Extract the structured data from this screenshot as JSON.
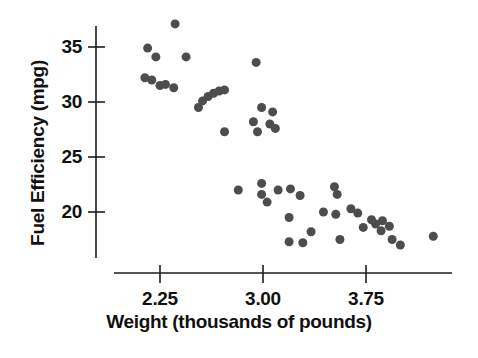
{
  "chart_data": {
    "type": "scatter",
    "title": "",
    "xlabel": "Weight (thousands of pounds)",
    "ylabel": "Fuel Efficiency (mpg)",
    "xlim": [
      1.89,
      4.33
    ],
    "ylim": [
      14.4,
      39.0
    ],
    "grid": false,
    "legend": null,
    "xticks": [
      2.25,
      3.0,
      3.75
    ],
    "xtick_labels": [
      "2.25",
      "3.00",
      "3.75"
    ],
    "yticks": [
      20,
      25,
      30,
      35
    ],
    "ytick_labels": [
      "20",
      "25",
      "30",
      "35"
    ],
    "marker_color": "#4d4d4d",
    "marker_size": 9,
    "axis_color": "#1c1c1c",
    "background_color": "#ffffff",
    "points": [
      {
        "x": 2.36,
        "y": 37.1
      },
      {
        "x": 2.16,
        "y": 34.9
      },
      {
        "x": 2.22,
        "y": 34.1
      },
      {
        "x": 2.44,
        "y": 34.1
      },
      {
        "x": 2.95,
        "y": 33.6
      },
      {
        "x": 2.14,
        "y": 32.2
      },
      {
        "x": 2.19,
        "y": 32.0
      },
      {
        "x": 2.25,
        "y": 31.5
      },
      {
        "x": 2.29,
        "y": 31.6
      },
      {
        "x": 2.35,
        "y": 31.3
      },
      {
        "x": 2.56,
        "y": 30.1
      },
      {
        "x": 2.6,
        "y": 30.5
      },
      {
        "x": 2.64,
        "y": 30.8
      },
      {
        "x": 2.68,
        "y": 31.0
      },
      {
        "x": 2.72,
        "y": 31.1
      },
      {
        "x": 2.53,
        "y": 29.5
      },
      {
        "x": 2.99,
        "y": 29.5
      },
      {
        "x": 3.07,
        "y": 29.1
      },
      {
        "x": 2.93,
        "y": 28.2
      },
      {
        "x": 3.05,
        "y": 28.0
      },
      {
        "x": 3.09,
        "y": 27.6
      },
      {
        "x": 2.96,
        "y": 27.3
      },
      {
        "x": 2.72,
        "y": 27.3
      },
      {
        "x": 2.82,
        "y": 22.0
      },
      {
        "x": 2.99,
        "y": 22.6
      },
      {
        "x": 2.99,
        "y": 21.6
      },
      {
        "x": 3.11,
        "y": 22.0
      },
      {
        "x": 3.03,
        "y": 20.9
      },
      {
        "x": 3.27,
        "y": 21.5
      },
      {
        "x": 3.35,
        "y": 18.2
      },
      {
        "x": 3.52,
        "y": 22.3
      },
      {
        "x": 3.53,
        "y": 19.8
      },
      {
        "x": 3.56,
        "y": 17.5
      },
      {
        "x": 3.29,
        "y": 17.2
      },
      {
        "x": 3.54,
        "y": 21.6
      },
      {
        "x": 3.64,
        "y": 20.3
      },
      {
        "x": 3.69,
        "y": 19.9
      },
      {
        "x": 3.73,
        "y": 18.6
      },
      {
        "x": 3.79,
        "y": 19.3
      },
      {
        "x": 3.82,
        "y": 18.9
      },
      {
        "x": 3.87,
        "y": 19.2
      },
      {
        "x": 3.86,
        "y": 18.3
      },
      {
        "x": 3.92,
        "y": 18.7
      },
      {
        "x": 3.94,
        "y": 17.5
      },
      {
        "x": 4.0,
        "y": 17.0
      },
      {
        "x": 4.24,
        "y": 17.8
      },
      {
        "x": 3.19,
        "y": 19.5
      },
      {
        "x": 3.19,
        "y": 17.3
      },
      {
        "x": 3.2,
        "y": 22.1
      },
      {
        "x": 3.44,
        "y": 20.0
      }
    ]
  }
}
